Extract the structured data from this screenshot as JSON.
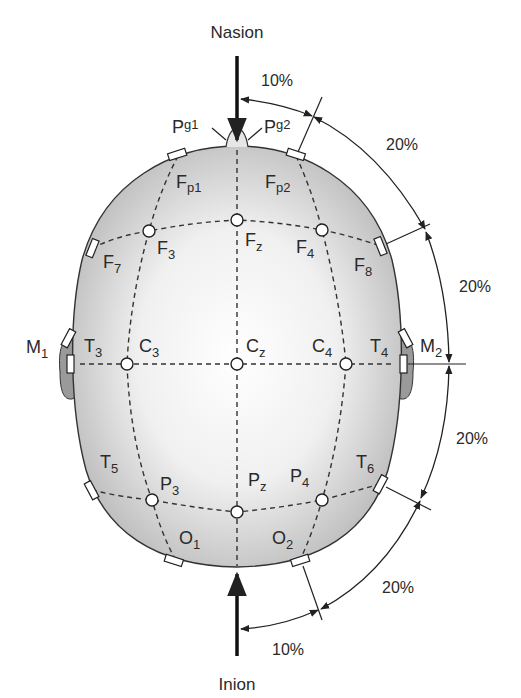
{
  "landmarks": {
    "top": "Nasion",
    "bottom": "Inion"
  },
  "percentages": {
    "top_arc": "10%",
    "upper_right_1": "20%",
    "upper_right_2": "20%",
    "lower_right_1": "20%",
    "lower_right_2": "20%",
    "bottom_arc": "10%"
  },
  "electrodes": {
    "Pg1": {
      "base": "P",
      "sub": "g1"
    },
    "Pg2": {
      "base": "P",
      "sub": "g2"
    },
    "Fp1": {
      "base": "F",
      "sub": "p1"
    },
    "Fp2": {
      "base": "F",
      "sub": "p2"
    },
    "F7": {
      "base": "F",
      "sub": "7"
    },
    "F3": {
      "base": "F",
      "sub": "3"
    },
    "Fz": {
      "base": "F",
      "sub": "z"
    },
    "F4": {
      "base": "F",
      "sub": "4"
    },
    "F8": {
      "base": "F",
      "sub": "8"
    },
    "M1": {
      "base": "M",
      "sub": "1"
    },
    "T3": {
      "base": "T",
      "sub": "3"
    },
    "C3": {
      "base": "C",
      "sub": "3"
    },
    "Cz": {
      "base": "C",
      "sub": "z"
    },
    "C4": {
      "base": "C",
      "sub": "4"
    },
    "T4": {
      "base": "T",
      "sub": "4"
    },
    "M2": {
      "base": "M",
      "sub": "2"
    },
    "T5": {
      "base": "T",
      "sub": "5"
    },
    "P3": {
      "base": "P",
      "sub": "3"
    },
    "Pz": {
      "base": "P",
      "sub": "z"
    },
    "P4": {
      "base": "P",
      "sub": "4"
    },
    "T6": {
      "base": "T",
      "sub": "6"
    },
    "O1": {
      "base": "O",
      "sub": "1"
    },
    "O2": {
      "base": "O",
      "sub": "2"
    }
  },
  "colors": {
    "head_edge": "#c4c4c4",
    "head_center": "#ffffff",
    "ear": "#9a9a9a",
    "line": "#222222"
  }
}
